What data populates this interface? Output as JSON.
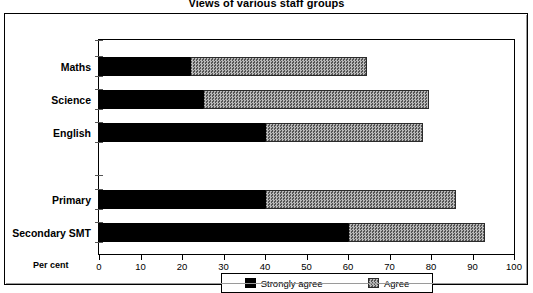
{
  "chart_data": {
    "type": "bar",
    "orientation": "horizontal",
    "stacked": true,
    "title": "Views of various staff groups",
    "xlabel": "Per cent",
    "ylabel": "",
    "xlim": [
      0,
      100
    ],
    "xticks": [
      0,
      10,
      20,
      30,
      40,
      50,
      60,
      70,
      80,
      90,
      100
    ],
    "xtick_labels": [
      "0",
      "10",
      "20",
      "30",
      "40",
      "50",
      "60",
      "70",
      "80",
      "90",
      "100"
    ],
    "grid": false,
    "legend_position": "bottom",
    "categories": [
      "Maths",
      "Science",
      "English",
      "",
      "Primary",
      "Secondary SMT"
    ],
    "series": [
      {
        "name": "Strongly agree",
        "color": "#000000",
        "values": [
          22,
          25,
          40,
          null,
          40,
          60
        ]
      },
      {
        "name": "Agree",
        "color": "#8f8f8f",
        "values": [
          42.5,
          54.6,
          38,
          null,
          46,
          33
        ]
      }
    ],
    "totals": [
      64.5,
      79.6,
      78,
      null,
      86,
      93
    ]
  },
  "title": {
    "text": "Views of various staff groups"
  },
  "axis": {
    "x_label": "Per cent",
    "ticks": [
      {
        "value": 0,
        "label": "0"
      },
      {
        "value": 10,
        "label": "10"
      },
      {
        "value": 20,
        "label": "20"
      },
      {
        "value": 30,
        "label": "30"
      },
      {
        "value": 40,
        "label": "40"
      },
      {
        "value": 50,
        "label": "50"
      },
      {
        "value": 60,
        "label": "60"
      },
      {
        "value": 70,
        "label": "70"
      },
      {
        "value": 80,
        "label": "80"
      },
      {
        "value": 90,
        "label": "90"
      },
      {
        "value": 100,
        "label": "100"
      }
    ]
  },
  "rows": [
    {
      "label": "Maths",
      "strongly_agree": 22,
      "agree": 42.5,
      "top": 17
    },
    {
      "label": "Science",
      "strongly_agree": 25,
      "agree": 54.6,
      "top": 50
    },
    {
      "label": "English",
      "strongly_agree": 40,
      "agree": 38,
      "top": 83
    },
    {
      "label": "Primary",
      "strongly_agree": 40,
      "agree": 46,
      "top": 150
    },
    {
      "label": "Secondary SMT",
      "strongly_agree": 60,
      "agree": 33,
      "top": 183
    }
  ],
  "legend": {
    "items": [
      {
        "label": "Strongly agree",
        "color": "#000000",
        "pattern": "solid"
      },
      {
        "label": "Agree",
        "color": "#8f8f8f",
        "pattern": "checker"
      }
    ]
  }
}
